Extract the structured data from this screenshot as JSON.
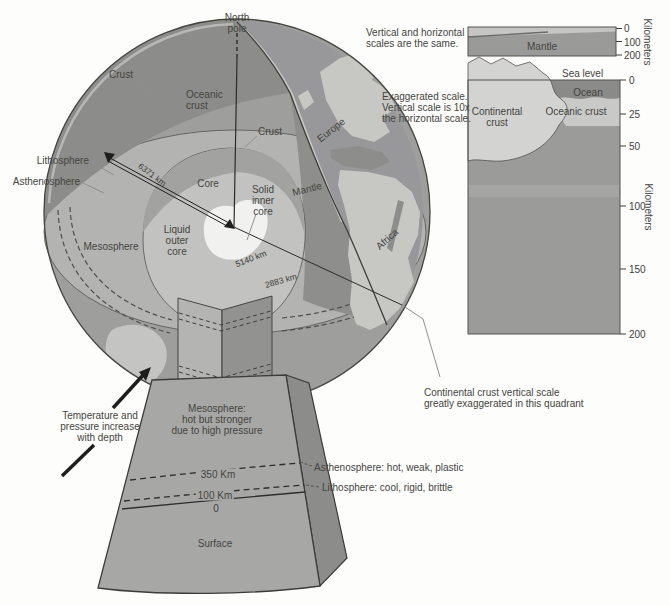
{
  "figure": {
    "globe": {
      "north_pole": "North\npole",
      "crust": "Crust",
      "oceanic_crust": "Oceanic\ncrust",
      "crust_surface": "Crust",
      "lithosphere": "Lithosphere",
      "asthenosphere": "Asthenosphere",
      "mesosphere": "Mesosphere",
      "core": "Core",
      "solid_inner_core": "Solid\ninner\ncore",
      "liquid_outer_core": "Liquid\nouter\ncore",
      "mantle": "Mantle",
      "europe": "Europe",
      "africa": "Africa",
      "radius_surface": "6371 km",
      "radius_inner_core": "5140 km",
      "radius_core_mantle": "2883 km"
    },
    "annotations": {
      "temperature": "Temperature and\npressure increase\nwith depth",
      "continental_quadrant": "Continental crust vertical scale\ngreatly exaggerated in this quadrant"
    },
    "wedge": {
      "mesosphere": "Mesosphere:\nhot but stronger\ndue to high pressure",
      "depth_350": "350 Km",
      "depth_100": "100 Km",
      "depth_0": "0",
      "surface": "Surface",
      "asthenosphere": "Asthenosphere: hot, weak, plastic",
      "lithosphere": "Lithosphere: cool, rigid, brittle"
    },
    "true_scale_panel": {
      "note": "Vertical and horizontal\nscales are the same.",
      "mantle": "Mantle",
      "ticks": [
        "0",
        "100",
        "200"
      ],
      "axis": "Kilometers"
    },
    "exaggerated_panel": {
      "note": "Exaggerated scale.\nVertical scale is 10x\nthe horizontal scale.",
      "sea_level": "Sea level",
      "ocean": "Ocean",
      "continental_crust": "Continental\ncrust",
      "oceanic_crust": "Oceanic crust",
      "ticks": [
        "0",
        "25",
        "50",
        "100",
        "150",
        "200"
      ],
      "axis": "Kilometers"
    },
    "colors": {
      "mantle_dark": "#8e8e8c",
      "disk_face": "#b3b3b1",
      "outer_core": "#c2c2c0",
      "inner_core": "#f1f1ef",
      "land": "#c7c7c4",
      "ocean": "#98989a"
    }
  }
}
